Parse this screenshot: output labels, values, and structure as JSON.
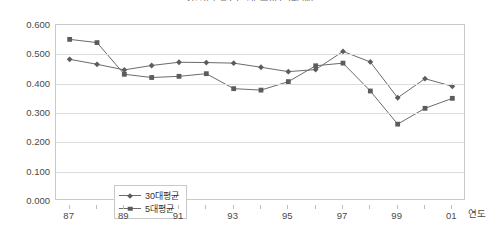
{
  "chart_data": {
    "type": "line",
    "title": "기업규모별 ( ) 평균 추이 (단위:배)",
    "xlabel": "연도",
    "ylabel": "",
    "ylim": [
      0.0,
      0.6
    ],
    "ytick_step": 0.1,
    "grid": true,
    "legend_position": "inside-lower-left",
    "x": [
      "87",
      "88",
      "89",
      "90",
      "91",
      "92",
      "93",
      "94",
      "95",
      "96",
      "97",
      "98",
      "99",
      "00",
      "01"
    ],
    "xtick_labels": [
      "87",
      "",
      "89",
      "",
      "91",
      "",
      "93",
      "",
      "95",
      "",
      "97",
      "",
      "99",
      "",
      "01"
    ],
    "ytick_labels": [
      "0.000",
      "0.100",
      "0.200",
      "0.300",
      "0.400",
      "0.500",
      "0.600"
    ],
    "series": [
      {
        "name": "30대평균",
        "marker": "diamond",
        "color": "#5c5c5c",
        "values": [
          0.483,
          0.466,
          0.447,
          0.462,
          0.473,
          0.472,
          0.47,
          0.456,
          0.441,
          0.448,
          0.51,
          0.474,
          0.352,
          0.417,
          0.391
        ]
      },
      {
        "name": "5대평균",
        "marker": "square",
        "color": "#5c5c5c",
        "values": [
          0.551,
          0.54,
          0.432,
          0.421,
          0.425,
          0.434,
          0.383,
          0.378,
          0.407,
          0.461,
          0.47,
          0.375,
          0.262,
          0.316,
          0.35
        ]
      }
    ]
  },
  "legend": {
    "items": [
      {
        "label": "30대평균",
        "marker": "diamond"
      },
      {
        "label": "5대평균",
        "marker": "square"
      }
    ]
  }
}
